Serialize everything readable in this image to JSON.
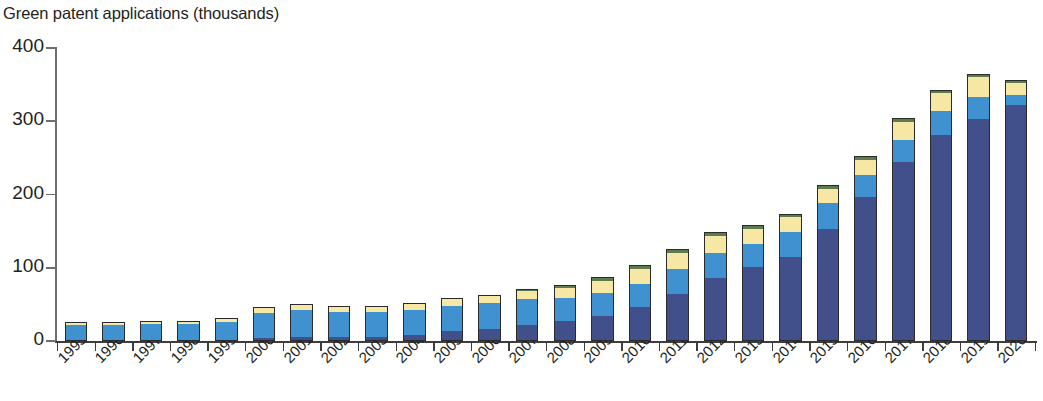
{
  "chart_data": {
    "type": "bar",
    "subtype": "stacked-column",
    "title": "Green patent applications (thousands)",
    "xlabel": "",
    "ylabel": "",
    "ylim": [
      0,
      400
    ],
    "yticks": [
      0,
      100,
      200,
      300,
      400
    ],
    "ytick_labels": [
      "0",
      "100",
      "200",
      "300",
      "400"
    ],
    "grid": false,
    "legend": "none",
    "x_label_rotation": -45,
    "categories": [
      "1995",
      "1996",
      "1997",
      "1998",
      "1999",
      "2000",
      "2001",
      "2002",
      "2003",
      "2004",
      "2005",
      "2006",
      "2007",
      "2008",
      "2009",
      "2010",
      "2011",
      "2012",
      "2013",
      "2014",
      "2015",
      "2016",
      "2017",
      "2018",
      "2019",
      "2020"
    ],
    "series": [
      {
        "name": "segment-1-navy",
        "color": "#414f8b",
        "values": [
          1,
          1,
          1,
          1,
          2,
          4,
          5,
          5,
          6,
          8,
          13,
          17,
          22,
          28,
          34,
          46,
          64,
          86,
          101,
          115,
          153,
          196,
          245,
          281,
          303,
          322
        ]
      },
      {
        "name": "segment-2-light-blue",
        "color": "#3f92cf",
        "values": [
          21,
          21,
          22,
          22,
          24,
          34,
          37,
          34,
          34,
          34,
          35,
          35,
          35,
          31,
          31,
          32,
          34,
          34,
          32,
          34,
          35,
          30,
          30,
          33,
          30,
          14
        ]
      },
      {
        "name": "segment-3-yellow",
        "color": "#f6e7a4",
        "values": [
          2,
          3,
          3,
          3,
          4,
          7,
          7,
          7,
          7,
          8,
          9,
          9,
          11,
          14,
          17,
          20,
          22,
          23,
          20,
          20,
          20,
          21,
          24,
          24,
          27,
          16
        ]
      },
      {
        "name": "segment-4-green",
        "color": "#5d7b4c",
        "values": [
          0.5,
          0.5,
          0.5,
          0.5,
          0.6,
          1,
          1,
          1,
          1,
          1.5,
          2,
          2,
          3,
          4,
          5,
          6,
          6,
          6,
          5,
          5,
          5,
          5,
          5,
          5,
          5,
          5
        ]
      }
    ],
    "totals": [
      24.5,
      25.5,
      26.5,
      26.5,
      30.6,
      46,
      50,
      47,
      48,
      51.5,
      59,
      63,
      71,
      77,
      87,
      104,
      126,
      149,
      158,
      174,
      213,
      252,
      304,
      343,
      365,
      357
    ],
    "colors": {
      "navy": "#414f8b",
      "light_blue": "#3f92cf",
      "yellow": "#f6e7a4",
      "green": "#5d7b4c",
      "axis": "#3d3d3d",
      "text": "#231f20",
      "outline": "#2b2b2b"
    }
  }
}
